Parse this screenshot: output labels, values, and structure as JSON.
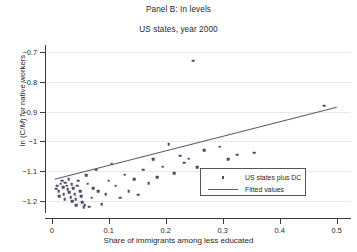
{
  "chart_data": {
    "type": "scatter",
    "title": "Panel B: In levels",
    "subtitle": "US states, year 2000",
    "xlabel": "Share of immigrants among less educated",
    "ylabel_prefix": "ln (C/",
    "ylabel_italic": "M",
    "ylabel_suffix": ") for native workers",
    "ylabel_plain": "ln (C/M) for native workers",
    "xlim": [
      -0.01,
      0.525
    ],
    "ylim": [
      -1.235,
      -0.675
    ],
    "xticks": [
      "0",
      "0.1",
      "0.2",
      "0.3",
      "0.4",
      "0.5"
    ],
    "xtick_values": [
      0,
      0.1,
      0.2,
      0.3,
      0.4,
      0.5
    ],
    "yticks": [
      "-0.7",
      "-0.8",
      "-0.9",
      "-1",
      "-1.1",
      "-1.2"
    ],
    "ytick_values": [
      -0.7,
      -0.8,
      -0.9,
      -1,
      -1.1,
      -1.2
    ],
    "grid": "horizontal",
    "legend_position": "inside-lower-right",
    "marker_color": "#4a4f63",
    "line_color": "#555e73",
    "grid_color": "#e9e9e9",
    "series": [
      {
        "name": "US states plus DC",
        "type": "scatter",
        "points": [
          [
            0.008,
            -1.16
          ],
          [
            0.01,
            -1.15
          ],
          [
            0.012,
            -1.168
          ],
          [
            0.013,
            -1.186
          ],
          [
            0.016,
            -1.143
          ],
          [
            0.018,
            -1.133
          ],
          [
            0.02,
            -1.155
          ],
          [
            0.021,
            -1.178
          ],
          [
            0.023,
            -1.196
          ],
          [
            0.024,
            -1.14
          ],
          [
            0.026,
            -1.15
          ],
          [
            0.028,
            -1.162
          ],
          [
            0.03,
            -1.128
          ],
          [
            0.031,
            -1.172
          ],
          [
            0.033,
            -1.188
          ],
          [
            0.035,
            -1.145
          ],
          [
            0.036,
            -1.202
          ],
          [
            0.038,
            -1.158
          ],
          [
            0.04,
            -1.178
          ],
          [
            0.042,
            -1.196
          ],
          [
            0.043,
            -1.216
          ],
          [
            0.045,
            -1.15
          ],
          [
            0.047,
            -1.133
          ],
          [
            0.05,
            -1.168
          ],
          [
            0.052,
            -1.186
          ],
          [
            0.054,
            -1.205
          ],
          [
            0.056,
            -1.222
          ],
          [
            0.058,
            -1.216
          ],
          [
            0.06,
            -1.115
          ],
          [
            0.063,
            -1.143
          ],
          [
            0.066,
            -1.22
          ],
          [
            0.07,
            -1.19
          ],
          [
            0.073,
            -1.158
          ],
          [
            0.078,
            -1.095
          ],
          [
            0.082,
            -1.168
          ],
          [
            0.088,
            -1.212
          ],
          [
            0.095,
            -1.178
          ],
          [
            0.1,
            -1.133
          ],
          [
            0.105,
            -1.075
          ],
          [
            0.112,
            -1.15
          ],
          [
            0.12,
            -1.19
          ],
          [
            0.128,
            -1.113
          ],
          [
            0.135,
            -1.168
          ],
          [
            0.145,
            -1.128
          ],
          [
            0.152,
            -1.18
          ],
          [
            0.16,
            -1.095
          ],
          [
            0.17,
            -1.142
          ],
          [
            0.178,
            -1.06
          ],
          [
            0.185,
            -1.12
          ],
          [
            0.195,
            -1.085
          ],
          [
            0.205,
            -1.01
          ],
          [
            0.215,
            -1.108
          ],
          [
            0.225,
            -1.048
          ],
          [
            0.232,
            -1.072
          ],
          [
            0.24,
            -1.058
          ],
          [
            0.248,
            -0.728
          ],
          [
            0.255,
            -1.088
          ],
          [
            0.268,
            -1.03
          ],
          [
            0.28,
            -1.16
          ],
          [
            0.295,
            -1.018
          ],
          [
            0.31,
            -1.06
          ],
          [
            0.325,
            -1.045
          ],
          [
            0.355,
            -1.038
          ],
          [
            0.478,
            -0.88
          ]
        ]
      },
      {
        "name": "Fitted values",
        "type": "line",
        "x": [
          0.005,
          0.5
        ],
        "y": [
          -1.128,
          -0.885
        ]
      }
    ],
    "legend": [
      {
        "label": "US states plus DC",
        "key": "marker"
      },
      {
        "label": "Fitted values",
        "key": "line"
      }
    ]
  }
}
